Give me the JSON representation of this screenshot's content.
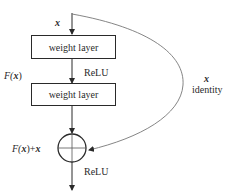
{
  "diagram": {
    "input_label": "x",
    "layers": [
      {
        "label": "weight layer"
      },
      {
        "label": "weight layer"
      }
    ],
    "activation_labels": [
      "ReLU",
      "ReLU"
    ],
    "residual_function_label_prefix": "F(",
    "residual_function_label_var": "x",
    "residual_function_label_suffix": ")",
    "sum_label_prefix": "F(",
    "sum_label_var1": "x",
    "sum_label_mid": ")+",
    "sum_label_var2": "x",
    "shortcut": {
      "var_label": "x",
      "name_label": "identity"
    },
    "operator": "addition",
    "colors": {
      "line": "#2a2a2a",
      "curve": "#777777",
      "background": "#ffffff"
    }
  }
}
